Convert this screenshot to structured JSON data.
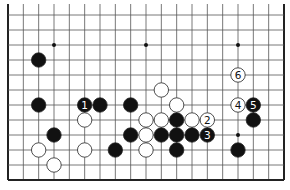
{
  "diagram": {
    "type": "go-board-partial",
    "board_size": 19,
    "visible_rows": 12,
    "edges": {
      "left": true,
      "right": true,
      "bottom": true,
      "top": false
    },
    "colors": {
      "line": "#555555",
      "edge": "#222222",
      "black": "#111111",
      "white": "#ffffff",
      "background": "#ffffff"
    },
    "star_points": [
      {
        "col": 3,
        "row": 9
      },
      {
        "col": 9,
        "row": 9
      },
      {
        "col": 15,
        "row": 9
      },
      {
        "col": 15,
        "row": 3
      }
    ],
    "stones": [
      {
        "color": "black",
        "col": 2,
        "row": 8
      },
      {
        "color": "black",
        "col": 2,
        "row": 5
      },
      {
        "color": "black",
        "col": 5,
        "row": 5,
        "label": "1"
      },
      {
        "color": "black",
        "col": 6,
        "row": 5
      },
      {
        "color": "black",
        "col": 8,
        "row": 5
      },
      {
        "color": "white",
        "col": 10,
        "row": 6
      },
      {
        "color": "white",
        "col": 11,
        "row": 5
      },
      {
        "color": "white",
        "col": 5,
        "row": 4
      },
      {
        "color": "white",
        "col": 9,
        "row": 4
      },
      {
        "color": "white",
        "col": 10,
        "row": 4
      },
      {
        "color": "black",
        "col": 11,
        "row": 4
      },
      {
        "color": "white",
        "col": 12,
        "row": 4
      },
      {
        "color": "white",
        "col": 13,
        "row": 4,
        "label": "2"
      },
      {
        "color": "black",
        "col": 3,
        "row": 3
      },
      {
        "color": "black",
        "col": 8,
        "row": 3
      },
      {
        "color": "white",
        "col": 9,
        "row": 3
      },
      {
        "color": "black",
        "col": 10,
        "row": 3
      },
      {
        "color": "black",
        "col": 11,
        "row": 3
      },
      {
        "color": "black",
        "col": 12,
        "row": 3
      },
      {
        "color": "black",
        "col": 13,
        "row": 3,
        "label": "3"
      },
      {
        "color": "white",
        "col": 2,
        "row": 2
      },
      {
        "color": "white",
        "col": 5,
        "row": 2
      },
      {
        "color": "black",
        "col": 7,
        "row": 2
      },
      {
        "color": "white",
        "col": 9,
        "row": 2
      },
      {
        "color": "black",
        "col": 11,
        "row": 2
      },
      {
        "color": "white",
        "col": 3,
        "row": 1
      },
      {
        "color": "white",
        "col": 15,
        "row": 7,
        "label": "6"
      },
      {
        "color": "white",
        "col": 15,
        "row": 5,
        "label": "4"
      },
      {
        "color": "black",
        "col": 16,
        "row": 5,
        "label": "5"
      },
      {
        "color": "black",
        "col": 16,
        "row": 4
      },
      {
        "color": "black",
        "col": 15,
        "row": 2
      }
    ]
  }
}
